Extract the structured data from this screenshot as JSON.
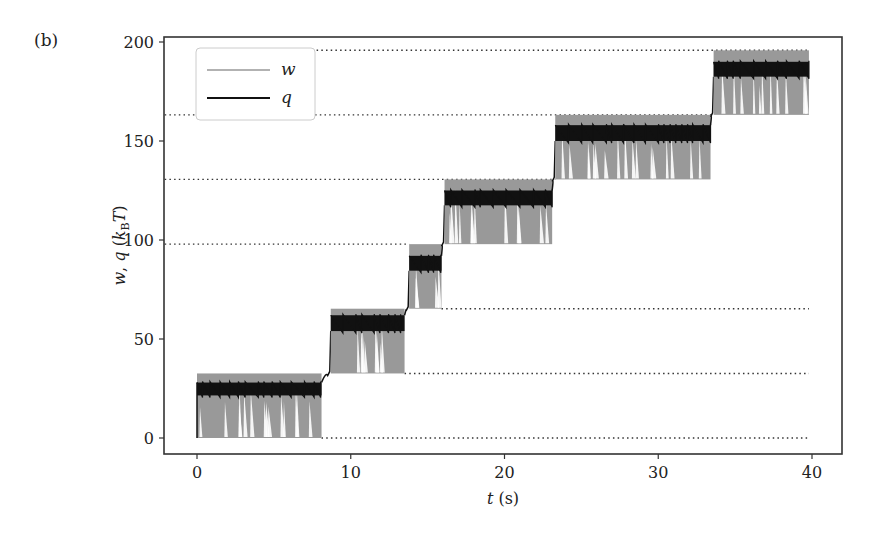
{
  "panel_label": "(b)",
  "chart_data": {
    "type": "line",
    "title": "",
    "xlabel": "t (s)",
    "ylabel": "w, q (k_B T)",
    "xlim": [
      -2.1,
      42
    ],
    "ylim": [
      -8,
      202
    ],
    "xticks": [
      0,
      10,
      20,
      30,
      40
    ],
    "yticks": [
      0,
      50,
      100,
      150,
      200
    ],
    "grid": false,
    "legend": {
      "position": "upper left",
      "entries": [
        {
          "label": "w",
          "color": "#999999"
        },
        {
          "label": "q",
          "color": "#111111"
        }
      ]
    },
    "reference_lines": {
      "style": "dotted",
      "color": "#333333",
      "segments": [
        {
          "y": 0.0,
          "x": [
            8.1,
            39.8
          ]
        },
        {
          "y": 32.6,
          "x": [
            13.5,
            39.8
          ]
        },
        {
          "y": 65.3,
          "x": [
            15.9,
            39.8
          ]
        },
        {
          "y": 97.9,
          "x": [
            -2.1,
            13.8
          ]
        },
        {
          "y": 130.6,
          "x": [
            -2.1,
            23.3
          ]
        },
        {
          "y": 163.2,
          "x": [
            -2.1,
            33.6
          ]
        },
        {
          "y": 195.8,
          "x": [
            3.5,
            39.8
          ]
        }
      ]
    },
    "steps": [
      {
        "t_start": 0.0,
        "t_end": 8.1,
        "w_low": 0.0,
        "w_high": 32.6,
        "q_low": 21.5,
        "q_high": 28.0
      },
      {
        "t_start": 8.7,
        "t_end": 13.5,
        "w_low": 32.6,
        "w_high": 65.3,
        "q_low": 54.0,
        "q_high": 62.0
      },
      {
        "t_start": 13.8,
        "t_end": 15.9,
        "w_low": 65.3,
        "w_high": 97.9,
        "q_low": 84.5,
        "q_high": 92.0
      },
      {
        "t_start": 16.1,
        "t_end": 23.1,
        "w_low": 97.9,
        "w_high": 130.6,
        "q_low": 117.5,
        "q_high": 125.0
      },
      {
        "t_start": 23.3,
        "t_end": 33.4,
        "w_low": 130.6,
        "w_high": 163.2,
        "q_low": 150.0,
        "q_high": 158.0
      },
      {
        "t_start": 33.6,
        "t_end": 39.8,
        "w_low": 163.2,
        "w_high": 195.8,
        "q_low": 182.5,
        "q_high": 190.0
      }
    ],
    "series": [
      {
        "name": "w",
        "color": "#999999",
        "description": "work, rapidly oscillating within each band"
      },
      {
        "name": "q",
        "color": "#111111",
        "description": "heat, sawtooth within narrower band"
      }
    ]
  }
}
